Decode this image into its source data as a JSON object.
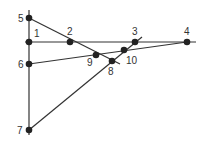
{
  "diagram": {
    "type": "line-intersection-diagram",
    "colors": {
      "line": "#333333",
      "point": "#222222",
      "label": "#333333",
      "background": "#ffffff"
    },
    "lines": [
      {
        "name": "vertical-line",
        "x1": 29,
        "y1": 10,
        "x2": 29,
        "y2": 135
      },
      {
        "name": "horizontal-line",
        "x1": 25,
        "y1": 42,
        "x2": 196,
        "y2": 42
      },
      {
        "name": "line-5-8",
        "x1": 29,
        "y1": 18,
        "x2": 120,
        "y2": 64
      },
      {
        "name": "line-6-4",
        "x1": 29,
        "y1": 64,
        "x2": 187,
        "y2": 42
      },
      {
        "name": "line-7-3",
        "x1": 29,
        "y1": 130,
        "x2": 142,
        "y2": 37
      }
    ],
    "points": [
      {
        "id": "1",
        "label": "1",
        "x": 29,
        "y": 42,
        "lx": 34,
        "ly": 37
      },
      {
        "id": "2",
        "label": "2",
        "x": 70,
        "y": 42,
        "lx": 67,
        "ly": 35
      },
      {
        "id": "3",
        "label": "3",
        "x": 135,
        "y": 42,
        "lx": 132,
        "ly": 35
      },
      {
        "id": "4",
        "label": "4",
        "x": 187,
        "y": 42,
        "lx": 184,
        "ly": 35
      },
      {
        "id": "5",
        "label": "5",
        "x": 29,
        "y": 18,
        "lx": 18,
        "ly": 22
      },
      {
        "id": "6",
        "label": "6",
        "x": 29,
        "y": 64,
        "lx": 18,
        "ly": 68
      },
      {
        "id": "7",
        "label": "7",
        "x": 29,
        "y": 130,
        "lx": 17,
        "ly": 134
      },
      {
        "id": "8",
        "label": "8",
        "x": 112,
        "y": 61,
        "lx": 108,
        "ly": 75
      },
      {
        "id": "9",
        "label": "9",
        "x": 96,
        "y": 55,
        "lx": 87,
        "ly": 66
      },
      {
        "id": "10",
        "label": "10",
        "x": 124,
        "y": 50,
        "lx": 126,
        "ly": 64
      }
    ]
  }
}
